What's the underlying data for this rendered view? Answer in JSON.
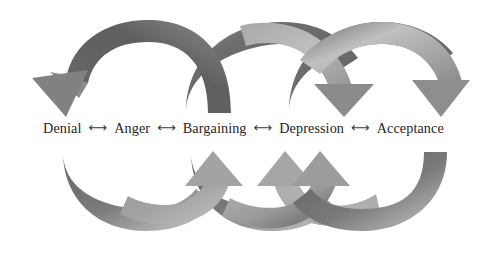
{
  "diagram": {
    "background_color": "#ffffff",
    "stages": [
      {
        "label": "Denial"
      },
      {
        "label": "Anger"
      },
      {
        "label": "Bargaining"
      },
      {
        "label": "Depression"
      },
      {
        "label": "Acceptance"
      }
    ],
    "separator_glyph": "⟷",
    "text_color": "#262626",
    "separator_color": "#3a3a3a",
    "arrow_colors": {
      "dark": "#5f5f5f",
      "mid": "#7d7d7d",
      "light": "#b4b4b4",
      "lighter": "#c9c9c9"
    },
    "top_arrows": [
      {
        "name": "arc-top-1",
        "from_stage": "Bargaining",
        "to_stage": "Denial",
        "direction": "down-left",
        "arrowhead": "down",
        "head_x": 60
      },
      {
        "name": "arc-top-2",
        "from_stage": "Denial",
        "to_stage": "Bargaining",
        "direction": "down-right",
        "arrowhead": "none",
        "head_x": 222
      },
      {
        "name": "arc-top-3",
        "from_stage": "Acceptance",
        "to_stage": "Depression",
        "direction": "down-left",
        "arrowhead": "down",
        "head_x": 344
      },
      {
        "name": "arc-top-4",
        "from_stage": "Bargaining",
        "to_stage": "Acceptance",
        "direction": "down-right",
        "arrowhead": "down",
        "head_x": 440
      }
    ],
    "bottom_arrows": [
      {
        "name": "arc-bottom-1",
        "from_stage": "Denial",
        "to_stage": "Bargaining",
        "direction": "up-right",
        "arrowhead": "up",
        "head_x": 213
      },
      {
        "name": "arc-bottom-2",
        "from_stage": "Bargaining",
        "to_stage": "Denial",
        "direction": "up-left",
        "arrowhead": "none",
        "head_x": 168
      },
      {
        "name": "arc-bottom-3",
        "from_stage": "Depression",
        "to_stage": "Bargaining",
        "direction": "up-left",
        "arrowhead": "up",
        "head_x": 285
      },
      {
        "name": "arc-bottom-4",
        "from_stage": "Acceptance",
        "to_stage": "Depression",
        "direction": "up-left",
        "arrowhead": "up",
        "head_x": 320
      }
    ]
  }
}
